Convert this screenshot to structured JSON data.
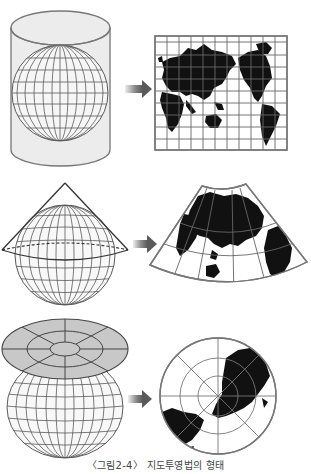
{
  "figure": {
    "caption": "〈그림2-4〉 지도투영법의 형태",
    "panels": [
      {
        "id": "cylindrical",
        "surface": "cylinder",
        "result": "cylindrical-map",
        "arrow": "right-arrow"
      },
      {
        "id": "conic",
        "surface": "cone",
        "result": "conic-map",
        "arrow": "right-arrow"
      },
      {
        "id": "azimuthal",
        "surface": "plane",
        "result": "azimuthal-map",
        "arrow": "right-arrow"
      }
    ]
  },
  "colors": {
    "background": "#ffffff",
    "outline": "#777777",
    "graticule": "#5a5a5a",
    "cylinder_fill": "#ececec",
    "plane_fill": "#c8c8c8",
    "landmass": "#111111",
    "arrow_dark": "#555555",
    "arrow_light": "#eeeeee",
    "caption_text": "#444444"
  }
}
